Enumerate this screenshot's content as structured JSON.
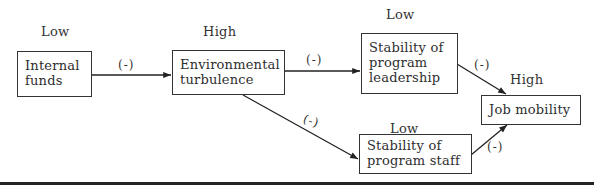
{
  "diagram": {
    "nodes": [
      {
        "id": "internal-funds",
        "lines": [
          "Internal",
          "funds"
        ],
        "level": "Low"
      },
      {
        "id": "environmental-turbulence",
        "lines": [
          "Environmental",
          "turbulence"
        ],
        "level": "High"
      },
      {
        "id": "stability-program-leadership",
        "lines": [
          "Stability of",
          "program",
          "leadership"
        ],
        "level": "Low"
      },
      {
        "id": "stability-program-staff",
        "lines": [
          "Stability of",
          "program staff"
        ],
        "level": "Low"
      },
      {
        "id": "job-mobility",
        "lines": [
          "Job mobility"
        ],
        "level": "High"
      }
    ],
    "edges": [
      {
        "from": "internal-funds",
        "to": "environmental-turbulence",
        "sign": "(-)"
      },
      {
        "from": "environmental-turbulence",
        "to": "stability-program-leadership",
        "sign": "(-)"
      },
      {
        "from": "environmental-turbulence",
        "to": "stability-program-staff",
        "sign": "(-)"
      },
      {
        "from": "stability-program-leadership",
        "to": "job-mobility",
        "sign": "(-)"
      },
      {
        "from": "stability-program-staff",
        "to": "job-mobility",
        "sign": "(-)"
      }
    ]
  }
}
